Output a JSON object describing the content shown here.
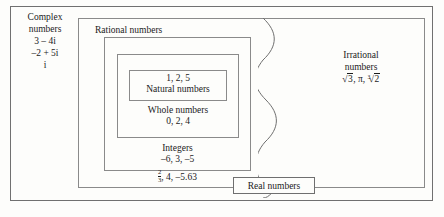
{
  "diagram": {
    "type": "nested-set-venn",
    "title_text": "",
    "sets": {
      "complex": {
        "name_line1": "Complex",
        "name_line2": "numbers",
        "examples": [
          "3 – 4i",
          "–2 + 5i",
          "i"
        ]
      },
      "real": {
        "name": "Real numbers"
      },
      "rational": {
        "name": "Rational numbers",
        "examples_prefix": "",
        "fraction": {
          "numerator": "2",
          "denominator": "3"
        },
        "examples_suffix": ", 4, –5.63"
      },
      "irrational": {
        "name_line1": "Irrational",
        "name_line2": "numbers",
        "examples": {
          "sqrt3": {
            "index": "",
            "radicand": "3"
          },
          "pi": "π",
          "cbrt2": {
            "index": "3",
            "radicand": "2"
          }
        }
      },
      "integers": {
        "name": "Integers",
        "examples": "–6, 3, –5"
      },
      "whole": {
        "name": "Whole numbers",
        "examples": "0, 2, 4"
      },
      "natural": {
        "name": "Natural numbers",
        "examples": "1, 2, 5"
      }
    },
    "colors": {
      "page_background": "#fdfdfb",
      "border": "#8a8a8a",
      "text": "#1b1b1b"
    }
  }
}
